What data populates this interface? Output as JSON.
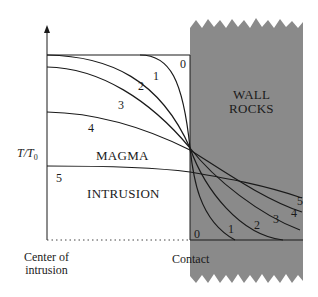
{
  "diagram": {
    "title": "",
    "y_axis_label": "T/T",
    "y_axis_label_sub": "0",
    "regions": {
      "magma": "MAGMA",
      "intrusion": "INTRUSION",
      "wall_line1": "WALL",
      "wall_line2": "ROCKS"
    },
    "x_labels": {
      "center_line1": "Center of",
      "center_line2": "intrusion",
      "contact": "Contact"
    },
    "curve_labels": {
      "magma_side": [
        "0",
        "1",
        "2",
        "3",
        "4",
        "5"
      ],
      "wall_side": [
        "0",
        "1",
        "2",
        "3",
        "4",
        "5"
      ]
    },
    "colors": {
      "wall_fill": "#8a8a8a",
      "line": "#1a1a1a",
      "background": "#ffffff"
    }
  }
}
